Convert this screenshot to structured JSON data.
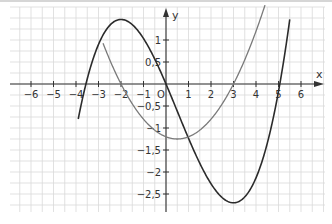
{
  "chart_data": {
    "type": "line",
    "title": "",
    "xlabel": "x",
    "ylabel": "y",
    "origin_label": "O",
    "xlim": [
      -6.9,
      7.0
    ],
    "ylim": [
      -2.9,
      1.75
    ],
    "grid": true,
    "x_ticks": [
      -6,
      -5,
      -4,
      -3,
      -2,
      -1,
      1,
      2,
      3,
      4,
      5,
      6
    ],
    "x_tick_labels": [
      "−6",
      "−5",
      "−4",
      "−3",
      "−2",
      "−1",
      "1",
      "2",
      "3",
      "4",
      "5",
      "6"
    ],
    "y_ticks": [
      1,
      0.5,
      -0.5,
      -1,
      -1.5,
      -2,
      -2.5
    ],
    "y_tick_labels": [
      "1",
      "0,5",
      "−0,5",
      "−1",
      "−1,5",
      "−2",
      "−2,5"
    ],
    "series": [
      {
        "name": "cubic",
        "formula": "0.2*(x^3/3 - x^2/2 - 6x)",
        "color": "#2b2b2b",
        "x_range": [
          -3.9,
          5.5
        ],
        "key_points": [
          {
            "x": -3.56,
            "y": 0
          },
          {
            "x": -2,
            "y": 1.47
          },
          {
            "x": 0,
            "y": 0
          },
          {
            "x": 3,
            "y": -2.7
          },
          {
            "x": 5.06,
            "y": 0
          }
        ]
      },
      {
        "name": "parabola",
        "formula": "0.2*(x+2)*(x-3)",
        "color": "#7a7a7a",
        "x_range": [
          -2.8,
          4.4
        ],
        "key_points": [
          {
            "x": -2,
            "y": 0
          },
          {
            "x": 0.5,
            "y": -1.25
          },
          {
            "x": 3,
            "y": 0
          }
        ]
      }
    ]
  }
}
